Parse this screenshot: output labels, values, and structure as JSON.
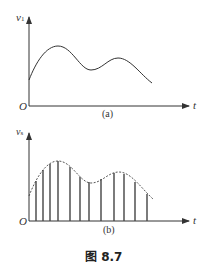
{
  "figure": {
    "caption": "图 8.7",
    "panels": [
      {
        "id": "a",
        "label": "(a)",
        "y_axis_label": "v",
        "y_axis_subscript": "1",
        "x_axis_label": "t",
        "origin_label": "O",
        "description": "continuous signal"
      },
      {
        "id": "b",
        "label": "(b)",
        "y_axis_label": "v",
        "y_axis_subscript": "s",
        "x_axis_label": "t",
        "origin_label": "O",
        "description": "sampled signal with dashed envelope and vertical sample lines"
      }
    ]
  },
  "colors": {
    "line": "#333333",
    "sample": "#444444"
  }
}
